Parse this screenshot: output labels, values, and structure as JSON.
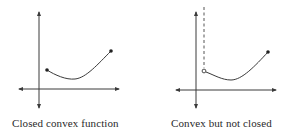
{
  "panels": [
    {
      "caption": "Closed convex function",
      "axes": {
        "x_axis": "horizontal-arrowed",
        "y_axis": "vertical-arrowed"
      },
      "curve": {
        "shape": "convex",
        "left_endpoint": "closed",
        "right_endpoint": "closed"
      }
    },
    {
      "caption": "Convex but not closed",
      "axes": {
        "x_axis": "horizontal-arrowed",
        "y_axis": "vertical-arrowed"
      },
      "curve": {
        "shape": "convex",
        "left_endpoint": "open",
        "right_endpoint": "closed",
        "vertical_asymptote": "dashed"
      }
    }
  ],
  "colors": {
    "stroke": "#3a3a3a",
    "text": "#2a2a2a",
    "background": "#ffffff"
  }
}
